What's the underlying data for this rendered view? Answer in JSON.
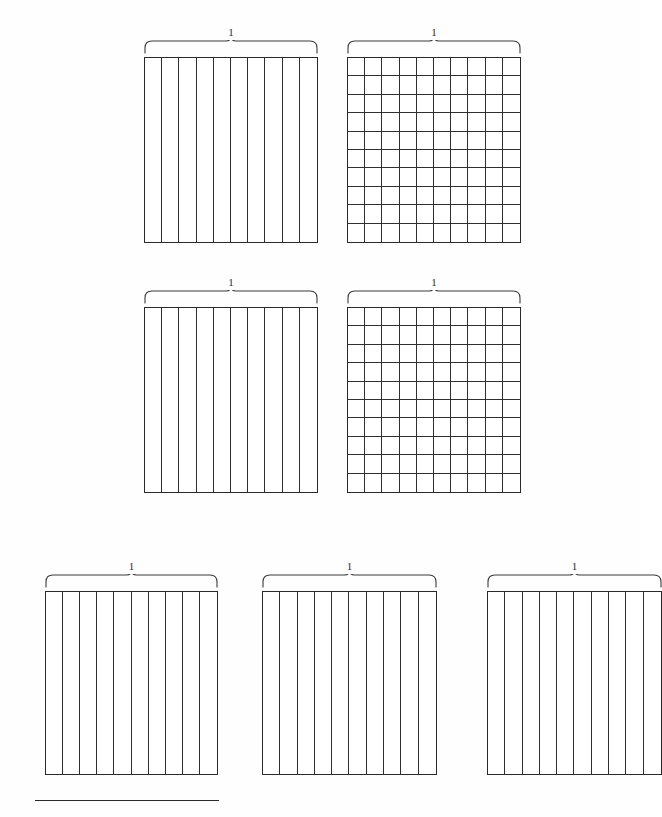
{
  "page": {
    "width": 640,
    "height": 817,
    "background_color": "#fefefe",
    "line_color": "#2a2a2a"
  },
  "figures": [
    {
      "id": "fig-r1-c1",
      "name": "tenths-strip-grid-1",
      "brace_label": "1",
      "columns": 10,
      "rows": 1,
      "total_cells": 10,
      "shaded_cells": 0,
      "x": 144,
      "y": 57,
      "width": 174,
      "height": 186,
      "clipped": false
    },
    {
      "id": "fig-r1-c2",
      "name": "hundredths-square-grid-1",
      "brace_label": "1",
      "columns": 10,
      "rows": 10,
      "total_cells": 100,
      "shaded_cells": 0,
      "x": 347,
      "y": 57,
      "width": 174,
      "height": 186,
      "clipped": false
    },
    {
      "id": "fig-r2-c1",
      "name": "tenths-strip-grid-2",
      "brace_label": "1",
      "columns": 10,
      "rows": 1,
      "total_cells": 10,
      "shaded_cells": 0,
      "x": 144,
      "y": 307,
      "width": 174,
      "height": 186,
      "clipped": false
    },
    {
      "id": "fig-r2-c2",
      "name": "hundredths-square-grid-2",
      "brace_label": "1",
      "columns": 10,
      "rows": 10,
      "total_cells": 100,
      "shaded_cells": 0,
      "x": 347,
      "y": 307,
      "width": 174,
      "height": 186,
      "clipped": false
    },
    {
      "id": "fig-r3-c1",
      "name": "tenths-strip-grid-3",
      "brace_label": "1",
      "columns": 10,
      "rows": 1,
      "total_cells": 10,
      "shaded_cells": 0,
      "x": 45,
      "y": 591,
      "width": 173,
      "height": 184,
      "clipped": false
    },
    {
      "id": "fig-r3-c2",
      "name": "tenths-strip-grid-4",
      "brace_label": "1",
      "columns": 10,
      "rows": 1,
      "total_cells": 10,
      "shaded_cells": 0,
      "x": 262,
      "y": 591,
      "width": 175,
      "height": 184,
      "clipped": false
    },
    {
      "id": "fig-r3-c3",
      "name": "tenths-strip-grid-5",
      "brace_label": "1",
      "columns": 10,
      "rows": 1,
      "total_cells": 10,
      "shaded_cells": 0,
      "x": 487,
      "y": 591,
      "width": 175,
      "height": 184,
      "clipped": true,
      "clip_note": "cut off at right page edge"
    }
  ],
  "footnote_rule": {
    "name": "footnote-separator",
    "x": 35,
    "y": 800,
    "width": 184,
    "height": 1.4
  }
}
